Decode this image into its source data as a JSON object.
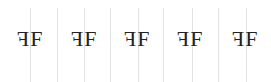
{
  "cells": [
    {
      "mirrored": "F",
      "normal": "F"
    },
    {
      "mirrored": "F",
      "normal": "F"
    },
    {
      "mirrored": "F",
      "normal": "F"
    },
    {
      "mirrored": "F",
      "normal": "F"
    },
    {
      "mirrored": "F",
      "normal": "F"
    }
  ],
  "colors": {
    "text": "#222222",
    "guide_line": "#e2e2e2",
    "background": "#ffffff"
  }
}
